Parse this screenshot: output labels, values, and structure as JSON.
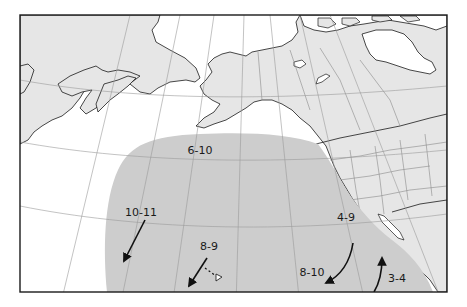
{
  "map": {
    "type": "Pacific Ocean region map (North Pacific, Alaska, Canada, western USA)",
    "colors": {
      "land": "#e6e6e6",
      "ocean": "#ffffff",
      "range": "#cdcdcd",
      "graticule": "#9a9a9a",
      "coast": "#1a1a1a",
      "frame": "#1a1a1a"
    },
    "labels": [
      {
        "id": "north",
        "text": "6-10",
        "x": 200,
        "y": 154
      },
      {
        "id": "west",
        "text": "10-11",
        "x": 141,
        "y": 216
      },
      {
        "id": "hawaii",
        "text": "8-9",
        "x": 209,
        "y": 250
      },
      {
        "id": "california",
        "text": "4-9",
        "x": 346,
        "y": 221
      },
      {
        "id": "southcoast",
        "text": "8-10",
        "x": 312,
        "y": 276
      },
      {
        "id": "mexico",
        "text": "3-4",
        "x": 397,
        "y": 282
      }
    ],
    "arrows": [
      {
        "id": "west-arrow",
        "from": [
          145,
          220
        ],
        "to": [
          124,
          261
        ]
      },
      {
        "id": "hawaii-arrow",
        "from": [
          207,
          258
        ],
        "to": [
          189,
          286
        ]
      },
      {
        "id": "southcoast-arrow",
        "from": [
          353,
          243
        ],
        "to": [
          326,
          283
        ]
      },
      {
        "id": "mexico-arrow",
        "from": [
          374,
          292
        ],
        "to": [
          382,
          258
        ]
      }
    ]
  }
}
